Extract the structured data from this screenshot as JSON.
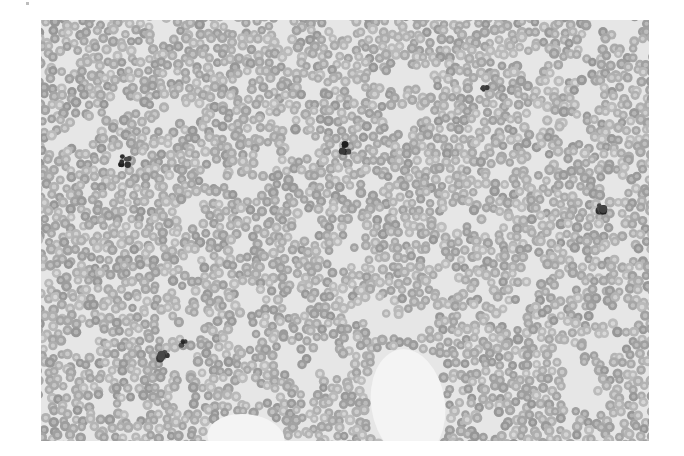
{
  "image": {
    "description": "Light micrograph of a blood smear showing densely packed red blood cells with scattered dark-staining platelet clumps and two cell-free areas",
    "frame": {
      "x": 41,
      "y": 20,
      "width": 608,
      "height": 421
    },
    "colors": {
      "page_background": "#ffffff",
      "field_background": "#e6e6e6",
      "cell_fill": "#a8a8a8",
      "cell_edge": "#8f8f8f",
      "cell_center": "#bcbcbc",
      "dark_clump": "#2e2e2e",
      "void": "#f4f4f4"
    },
    "cell": {
      "radius_min": 4.2,
      "radius_max": 5.4,
      "spacing": 9.2,
      "jitter": 3.2,
      "seed": 7
    },
    "dark_clumps": [
      {
        "x": 84,
        "y": 141,
        "size": 9
      },
      {
        "x": 305,
        "y": 128,
        "size": 8
      },
      {
        "x": 443,
        "y": 68,
        "size": 6
      },
      {
        "x": 560,
        "y": 188,
        "size": 9
      },
      {
        "x": 124,
        "y": 337,
        "size": 10
      },
      {
        "x": 143,
        "y": 323,
        "size": 6
      }
    ],
    "voids": [
      {
        "type": "ellipse",
        "cx": 367,
        "cy": 384,
        "rx": 40,
        "ry": 60,
        "rotation": -0.15
      },
      {
        "type": "ellipse",
        "cx": 205,
        "cy": 418,
        "rx": 42,
        "ry": 26,
        "rotation": 0.1
      }
    ],
    "small_gaps": 140
  }
}
